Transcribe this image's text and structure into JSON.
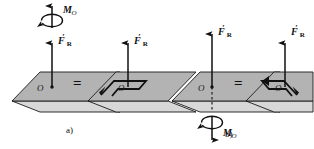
{
  "figure": {
    "background_color": "#ffffff",
    "plane_fill_color": "#b3b3b3",
    "plane_edge_color": "#1a1a1a",
    "arrow_color": "#111111",
    "width": 314,
    "height": 149
  },
  "panel_a": {
    "caption": "a)",
    "moment_label": "M",
    "moment_subscript": "O",
    "moment_direction": "up",
    "left_system": {
      "force_label": "F",
      "force_prime": "′",
      "force_subscript": "R",
      "origin_label": "O",
      "force_direction": "up"
    },
    "equals_sign": "=",
    "right_system": {
      "force_label": "F",
      "force_prime": "′",
      "force_subscript": "R",
      "origin_label": "O",
      "force_direction": "up",
      "couple_arrow": "hooked-in-plane-counterclockwise"
    }
  },
  "panel_b": {
    "caption": "b)",
    "moment_label": "M",
    "moment_subscript": "O",
    "moment_direction": "down",
    "left_system": {
      "force_label": "F",
      "force_prime": "′",
      "force_subscript": "R",
      "origin_label": "O",
      "force_direction": "up"
    },
    "equals_sign": "=",
    "right_system": {
      "force_label": "F",
      "force_prime": "′",
      "force_subscript": "R",
      "origin_label": "O",
      "force_direction": "up",
      "couple_arrow": "hooked-in-plane-clockwise"
    }
  }
}
